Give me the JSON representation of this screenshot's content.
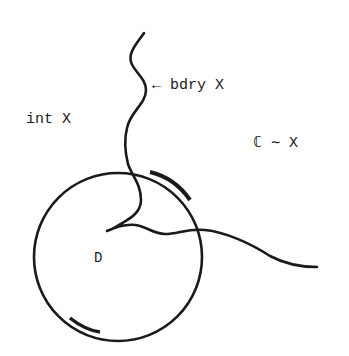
{
  "diagram": {
    "labels": {
      "boundary": "← bdry X",
      "interior": "int X",
      "complement": "ℂ ∼ X",
      "disk": "D"
    },
    "colors": {
      "ink": "#1a1a1a",
      "background": "#ffffff"
    },
    "shapes": {
      "circle": {
        "cx": 118,
        "cy": 257,
        "r": 84
      },
      "boundary_curve": "wavy curve from top (143,33) winding down into the circle to a cusp near (107,230), then continuing right out of the circle to (316,267)"
    }
  }
}
